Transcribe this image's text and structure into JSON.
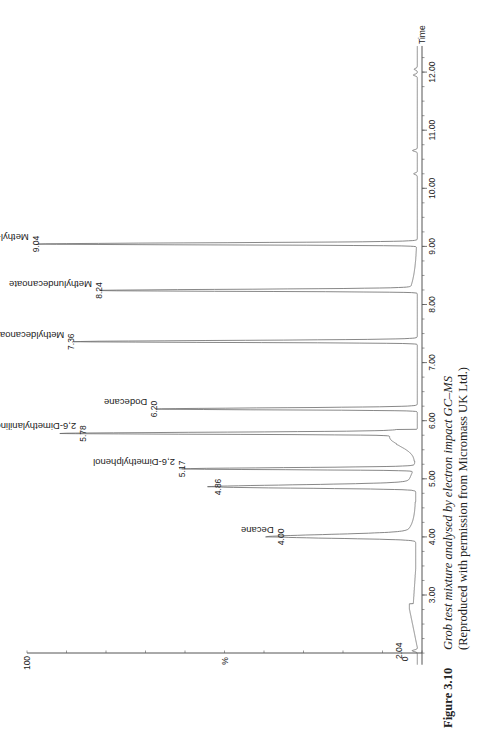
{
  "chart_data": {
    "type": "line",
    "title": "Grob test mixture analysed by electron impact GC–MS",
    "xlabel": "Time",
    "ylabel": "%",
    "orientation": "rotated 90° (time axis vertical on right, intensity increases to the left)",
    "xlim": [
      1.8,
      12.4
    ],
    "ylim": [
      0,
      100
    ],
    "x_ticks": [
      "3.00",
      "4.00",
      "5.00",
      "6.00",
      "7.00",
      "8.00",
      "9.00",
      "10.00",
      "11.00",
      "12.00"
    ],
    "y_ticks": [
      "0",
      "%",
      "100"
    ],
    "grid": false,
    "legend": null,
    "peaks": [
      {
        "rt": 2.04,
        "rt_label": "2.04",
        "name": "",
        "intensity": 1
      },
      {
        "rt": 4.0,
        "rt_label": "4.00",
        "name": "Decane",
        "intensity": 34
      },
      {
        "rt": 4.86,
        "rt_label": "4.86",
        "name": "",
        "intensity": 50
      },
      {
        "rt": 5.17,
        "rt_label": "5.17",
        "name": "2,6-Dimethylphenol",
        "intensity": 59
      },
      {
        "rt": 5.78,
        "rt_label": "5.78",
        "name": "2,6-Dimethylaniline",
        "intensity": 84
      },
      {
        "rt": 6.2,
        "rt_label": "6.20",
        "name": "Dodecane",
        "intensity": 66
      },
      {
        "rt": 7.36,
        "rt_label": "7.36",
        "name": "Methyldecanoate",
        "intensity": 87
      },
      {
        "rt": 8.24,
        "rt_label": "8.24",
        "name": "Methylundecanoate",
        "intensity": 80
      },
      {
        "rt": 9.04,
        "rt_label": "9.04",
        "name": "Methyl-laurate",
        "intensity": 96
      }
    ]
  },
  "axis": {
    "time_label": "Time",
    "pct_label": "%",
    "y_min_label": "0",
    "y_max_label": "100",
    "ticks": [
      {
        "t": 3,
        "label": "3.00"
      },
      {
        "t": 4,
        "label": "4.00"
      },
      {
        "t": 5,
        "label": "5.00"
      },
      {
        "t": 6,
        "label": "6.00"
      },
      {
        "t": 7,
        "label": "7.00"
      },
      {
        "t": 8,
        "label": "8.00"
      },
      {
        "t": 9,
        "label": "9.00"
      },
      {
        "t": 10,
        "label": "10.00"
      },
      {
        "t": 11,
        "label": "11.00"
      },
      {
        "t": 12,
        "label": "12.00"
      }
    ]
  },
  "caption": {
    "figure_label": "Figure 3.10",
    "title": "Grob test mixture analysed by electron impact GC–MS",
    "credit": "(Reproduced with permission from Micromass UK Ltd.)"
  },
  "colors": {
    "trace": "#6a6a6a",
    "axis": "#555555",
    "text": "#222222"
  }
}
